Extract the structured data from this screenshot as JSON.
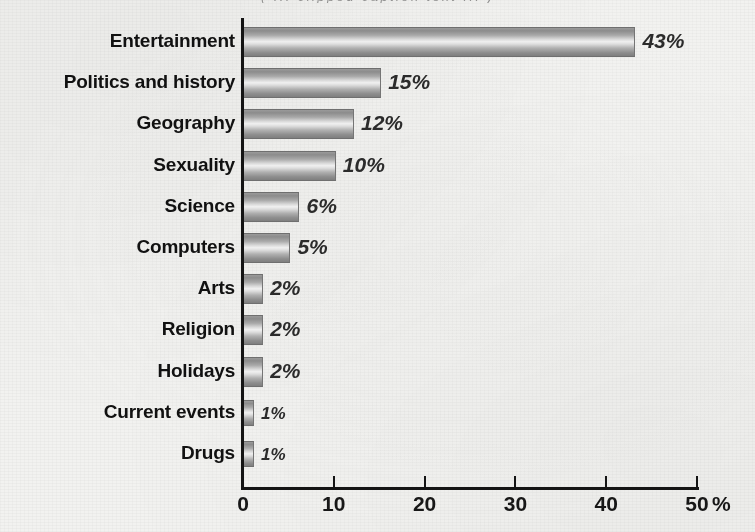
{
  "caption": {
    "clipped_top_line": "( ... clipped caption text ... )"
  },
  "chart_data": {
    "type": "bar",
    "orientation": "horizontal",
    "title": "",
    "subtitle": "",
    "xlabel": "%",
    "ylabel": "",
    "xlim": [
      0,
      50
    ],
    "grid": false,
    "legend": null,
    "axis_unit_label": "%",
    "x_ticks": [
      0,
      10,
      20,
      30,
      40,
      50
    ],
    "x_tick_labels": [
      "0",
      "10",
      "20",
      "30",
      "40",
      "50"
    ],
    "categories": [
      "Entertainment",
      "Politics and history",
      "Geography",
      "Sexuality",
      "Science",
      "Computers",
      "Arts",
      "Religion",
      "Holidays",
      "Current events",
      "Drugs"
    ],
    "values": [
      43,
      15,
      12,
      10,
      6,
      5,
      2,
      2,
      2,
      1,
      1
    ],
    "value_labels": [
      "43%",
      "15%",
      "12%",
      "10%",
      "6%",
      "5%",
      "2%",
      "2%",
      "2%",
      "1%",
      "1%"
    ],
    "bar_fill": "#b0b0b0",
    "bar_edge": "#6f6f6f",
    "axis_color": "#141414",
    "label_color": "#111111",
    "value_label_color": "#2b2b2b",
    "background": "#f2f2f0"
  },
  "geometry": {
    "plot_left_px": 243,
    "plot_right_px": 697,
    "value_per_px": 0.1101,
    "first_row_center_y": 41,
    "row_pitch_y": 41.2,
    "bar_height_px": 28,
    "thin_bar_height_px": 24
  }
}
